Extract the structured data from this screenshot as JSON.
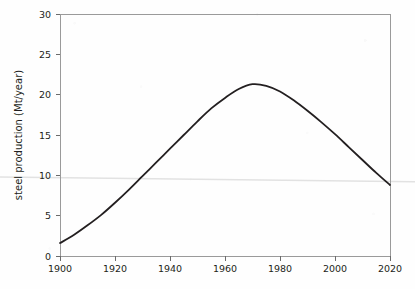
{
  "chart_data": {
    "type": "line",
    "title": "",
    "subtitle": "",
    "xlabel": "",
    "ylabel": "steel production (Mt/year)",
    "xlim": [
      1900,
      2020
    ],
    "ylim": [
      0,
      30
    ],
    "xticks": [
      1900,
      1920,
      1940,
      1960,
      1980,
      2000,
      2020
    ],
    "xtick_labels": [
      "1900",
      "1920",
      "1940",
      "1960",
      "1980",
      "2000",
      "2020"
    ],
    "yticks": [
      0,
      5,
      10,
      15,
      20,
      25,
      30
    ],
    "ytick_labels": [
      "0",
      "5",
      "10",
      "15",
      "20",
      "25",
      "30"
    ],
    "grid": false,
    "legend": null,
    "legend_position": "none",
    "line_color": "#231f20",
    "line_width": 1.8,
    "frame": true,
    "frame_color": "#9a9a9a",
    "series": [
      {
        "name": "steel production",
        "x": [
          1900,
          1905,
          1910,
          1915,
          1920,
          1925,
          1930,
          1935,
          1940,
          1945,
          1950,
          1955,
          1960,
          1965,
          1970,
          1975,
          1980,
          1985,
          1990,
          1995,
          2000,
          2005,
          2010,
          2015,
          2020
        ],
        "values": [
          1.6,
          2.6,
          3.8,
          5.1,
          6.6,
          8.2,
          9.9,
          11.6,
          13.3,
          15.0,
          16.7,
          18.3,
          19.6,
          20.7,
          21.3,
          21.1,
          20.4,
          19.3,
          18.0,
          16.6,
          15.1,
          13.5,
          11.9,
          10.3,
          8.8
        ]
      }
    ],
    "annotations": [
      {
        "name": "scan-artifact-line",
        "type": "horizontal-streak",
        "y_start_value": 9.8,
        "y_end_value": 9.2,
        "color": "#e2e2e2"
      }
    ]
  }
}
